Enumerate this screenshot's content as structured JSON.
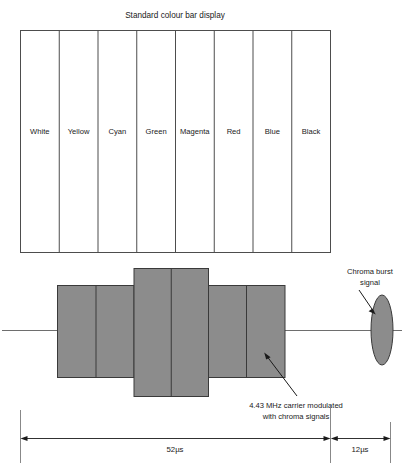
{
  "figure": {
    "title": "Standard colour bar display",
    "colors": {
      "block_fill": "#8c8c8c",
      "block_stroke": "#3a3a3a",
      "frame_stroke": "#4d4d4d",
      "baseline_stroke": "#6e6e6e",
      "text": "#1a1a1a",
      "background": "#ffffff"
    }
  },
  "colour_bars": {
    "labels": [
      "White",
      "Yellow",
      "Cyan",
      "Green",
      "Magenta",
      "Red",
      "Blue",
      "Black"
    ]
  },
  "waveform": {
    "blocks": [
      {
        "label": "White",
        "level": "mid"
      },
      {
        "label": "Yellow",
        "level": "mid"
      },
      {
        "label": "Cyan",
        "level": "high"
      },
      {
        "label": "Green",
        "level": "high"
      },
      {
        "label": "Magenta",
        "level": "mid"
      },
      {
        "label": "Red",
        "level": "mid"
      }
    ]
  },
  "annotations": {
    "burst": {
      "line1": "Chroma burst",
      "line2": "signal"
    },
    "carrier": {
      "line1": "4.43 MHz carrier modulated",
      "line2": "with chroma signals"
    }
  },
  "dimensions": {
    "active_line": "52µs",
    "blanking": "12µs"
  }
}
